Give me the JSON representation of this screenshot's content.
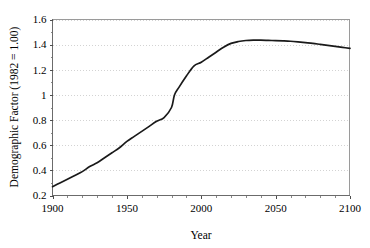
{
  "chart_data": {
    "type": "line",
    "title": "",
    "xlabel": "Year",
    "ylabel": "Demographic Factor (1982 = 1.00)",
    "xlim": [
      1900,
      2100
    ],
    "ylim": [
      0.2,
      1.6
    ],
    "grid": "horizontal-dotted",
    "legend": "none",
    "x_major_ticks": [
      1900,
      1950,
      2000,
      2050,
      2100
    ],
    "x_major_tick_labels": [
      "1900",
      "1950",
      "2000",
      "2050",
      "2100"
    ],
    "x_minor_tick_interval": 10,
    "y_major_ticks": [
      0.2,
      0.4,
      0.6,
      0.8,
      1,
      1.2,
      1.4,
      1.6
    ],
    "y_major_tick_labels": [
      "0.2",
      "0.4",
      "0.6",
      "0.8",
      "1",
      "1.2",
      "1.4",
      "1.6"
    ],
    "y_minor_tick_interval": 0.1,
    "series": [
      {
        "name": "Demographic Factor",
        "color": "#1a1a1a",
        "x": [
          1900,
          1905,
          1910,
          1915,
          1920,
          1925,
          1930,
          1935,
          1940,
          1945,
          1950,
          1955,
          1960,
          1965,
          1970,
          1975,
          1980,
          1982,
          1985,
          1990,
          1995,
          2000,
          2005,
          2010,
          2015,
          2020,
          2025,
          2030,
          2035,
          2040,
          2045,
          2050,
          2055,
          2060,
          2065,
          2070,
          2075,
          2080,
          2085,
          2090,
          2095,
          2100
        ],
        "values": [
          0.27,
          0.3,
          0.33,
          0.36,
          0.39,
          0.43,
          0.46,
          0.5,
          0.54,
          0.58,
          0.63,
          0.67,
          0.71,
          0.75,
          0.79,
          0.82,
          0.9,
          1.0,
          1.06,
          1.15,
          1.23,
          1.26,
          1.3,
          1.34,
          1.38,
          1.41,
          1.425,
          1.433,
          1.436,
          1.436,
          1.434,
          1.432,
          1.43,
          1.427,
          1.422,
          1.416,
          1.41,
          1.402,
          1.394,
          1.386,
          1.378,
          1.37
        ]
      }
    ]
  },
  "axes": {
    "x_title": "Year",
    "y_title": "Demographic Factor (1982 = 1.00)"
  }
}
